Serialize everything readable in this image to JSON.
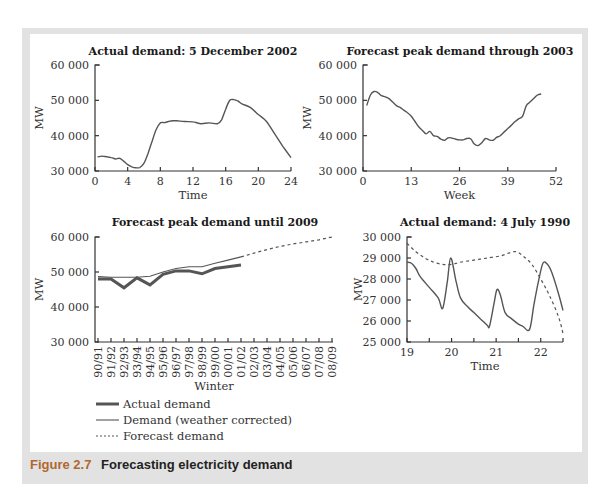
{
  "figure": {
    "caption_number": "Figure 2.7",
    "caption_text": "Forecasting electricity demand"
  },
  "chart_data": [
    {
      "id": "chart1",
      "type": "line",
      "title": "Actual demand: 5 December 2002",
      "xlabel": "Time",
      "ylabel": "MW",
      "xlim": [
        0,
        24
      ],
      "ylim": [
        30000,
        60000
      ],
      "xticks": [
        "0",
        "4",
        "8",
        "12",
        "16",
        "20",
        "24"
      ],
      "yticks": [
        "30 000",
        "40 000",
        "50 000",
        "60 000"
      ],
      "grid": false,
      "series": [
        {
          "name": "Actual demand",
          "x": [
            0.3,
            1,
            2,
            2.5,
            3,
            3.5,
            4,
            4.5,
            5,
            5.5,
            6,
            6.5,
            7,
            7.5,
            8,
            8.5,
            9,
            9.5,
            10,
            11,
            12,
            13,
            14,
            15,
            15.5,
            16,
            16.5,
            17,
            17.5,
            18,
            19,
            20,
            21,
            22,
            23,
            24
          ],
          "y": [
            34000,
            34200,
            33800,
            33400,
            33600,
            32800,
            31800,
            31200,
            30900,
            31000,
            32200,
            35000,
            38500,
            41800,
            43600,
            43700,
            44000,
            44200,
            44200,
            44000,
            43900,
            43400,
            43600,
            43400,
            44500,
            47500,
            50000,
            50200,
            49800,
            49000,
            48000,
            46000,
            44000,
            40500,
            37000,
            33800
          ]
        }
      ]
    },
    {
      "id": "chart2",
      "type": "line",
      "title": "Forecast peak demand through 2003",
      "xlabel": "Week",
      "ylabel": "MW",
      "xlim": [
        0,
        52
      ],
      "ylim": [
        30000,
        60000
      ],
      "xticks": [
        "0",
        "13",
        "26",
        "39",
        "52"
      ],
      "yticks": [
        "30 000",
        "40 000",
        "50 000",
        "60 000"
      ],
      "grid": false,
      "series": [
        {
          "name": "Forecast peak demand",
          "x": [
            1,
            2,
            3,
            4,
            5,
            6,
            7,
            8,
            9,
            10,
            11,
            12,
            13,
            14,
            15,
            16,
            17,
            18,
            19,
            20,
            21,
            22,
            23,
            24,
            25,
            26,
            27,
            28,
            29,
            30,
            31,
            32,
            33,
            34,
            35,
            36,
            37,
            38,
            39,
            40,
            41,
            42,
            43,
            44,
            45,
            46,
            47,
            48
          ],
          "y": [
            48500,
            51500,
            52500,
            52200,
            51300,
            51000,
            50500,
            49500,
            48500,
            48000,
            47200,
            46500,
            45500,
            44000,
            42500,
            41500,
            40500,
            41200,
            40000,
            39800,
            39000,
            38700,
            39400,
            39300,
            39000,
            38800,
            38800,
            39200,
            39100,
            37600,
            37200,
            38000,
            39200,
            38800,
            38700,
            39500,
            40000,
            41000,
            42000,
            43000,
            44000,
            44800,
            45500,
            48500,
            49500,
            50500,
            51500,
            51800
          ]
        }
      ]
    },
    {
      "id": "chart3",
      "type": "line",
      "title": "Forecast peak demand until 2009",
      "xlabel": "Winter",
      "ylabel": "MW",
      "ylim": [
        30000,
        60000
      ],
      "yticks": [
        "30 000",
        "40 000",
        "50 000",
        "60 000"
      ],
      "categories": [
        "90/91",
        "91/92",
        "92/93",
        "93/94",
        "94/95",
        "95/96",
        "96/97",
        "97/98",
        "98/99",
        "99/00",
        "00/01",
        "01/02",
        "02/03",
        "03/04",
        "04/05",
        "05/06",
        "06/07",
        "07/08",
        "08/09"
      ],
      "grid": false,
      "legend_position": "below",
      "series": [
        {
          "name": "Actual demand",
          "style": "thick-solid",
          "values": [
            48000,
            48000,
            45500,
            48300,
            46300,
            49300,
            50300,
            50300,
            49500,
            51000,
            51500,
            52000,
            null,
            null,
            null,
            null,
            null,
            null,
            null
          ]
        },
        {
          "name": "Demand (weather corrected)",
          "style": "thin-solid",
          "values": [
            48700,
            48500,
            48500,
            48500,
            48800,
            50000,
            51000,
            51500,
            51500,
            52500,
            53400,
            54300,
            null,
            null,
            null,
            null,
            null,
            null,
            null
          ]
        },
        {
          "name": "Forecast demand",
          "style": "dashed",
          "values": [
            null,
            null,
            null,
            null,
            null,
            null,
            null,
            null,
            null,
            null,
            null,
            54300,
            55400,
            56400,
            57300,
            58000,
            58600,
            59200,
            60000
          ]
        }
      ]
    },
    {
      "id": "chart4",
      "type": "line",
      "title": "Actual demand: 4 July 1990",
      "xlabel": "Time",
      "ylabel": "MW",
      "xlim": [
        19,
        22.5
      ],
      "ylim": [
        25000,
        30000
      ],
      "xticks": [
        "19",
        "20",
        "21",
        "22"
      ],
      "yticks": [
        "25 000",
        "26 000",
        "27 000",
        "28 000",
        "29 000",
        "30 000"
      ],
      "grid": false,
      "series": [
        {
          "name": "Actual demand",
          "style": "solid",
          "x": [
            19,
            19.1,
            19.2,
            19.3,
            19.5,
            19.7,
            19.8,
            19.9,
            19.98,
            20.1,
            20.2,
            20.35,
            20.5,
            20.65,
            20.8,
            20.85,
            20.95,
            21.02,
            21.1,
            21.2,
            21.35,
            21.5,
            21.6,
            21.75,
            21.85,
            21.95,
            22.05,
            22.15,
            22.25,
            22.4,
            22.5
          ],
          "y": [
            28800,
            28750,
            28500,
            28100,
            27600,
            27100,
            26600,
            27800,
            29000,
            27900,
            27100,
            26700,
            26400,
            26100,
            25800,
            25750,
            26800,
            27500,
            27200,
            26400,
            26100,
            25850,
            25750,
            25600,
            26800,
            27900,
            28750,
            28700,
            28300,
            27300,
            26500
          ]
        },
        {
          "name": "Forecast demand",
          "style": "dashed",
          "x": [
            19,
            19.2,
            19.4,
            19.6,
            19.8,
            20,
            20.2,
            20.5,
            20.8,
            21.1,
            21.3,
            21.45,
            21.6,
            21.8,
            22,
            22.2,
            22.4,
            22.5
          ],
          "y": [
            29700,
            29300,
            29000,
            28800,
            28700,
            28700,
            28800,
            28900,
            29000,
            29100,
            29250,
            29300,
            29100,
            28700,
            28000,
            27200,
            26200,
            25400
          ]
        }
      ]
    }
  ],
  "legend": {
    "items": [
      {
        "label": "Actual demand",
        "style": "thick-solid"
      },
      {
        "label": "Demand (weather corrected)",
        "style": "thin-solid"
      },
      {
        "label": "Forecast demand",
        "style": "dashed"
      }
    ]
  },
  "colors": {
    "frame": "#e2e2e2",
    "actual_line": "#555555",
    "thin_line": "#555555",
    "forecast_line": "#555555",
    "caption_number": "#b0682e",
    "caption_text": "#222222"
  }
}
